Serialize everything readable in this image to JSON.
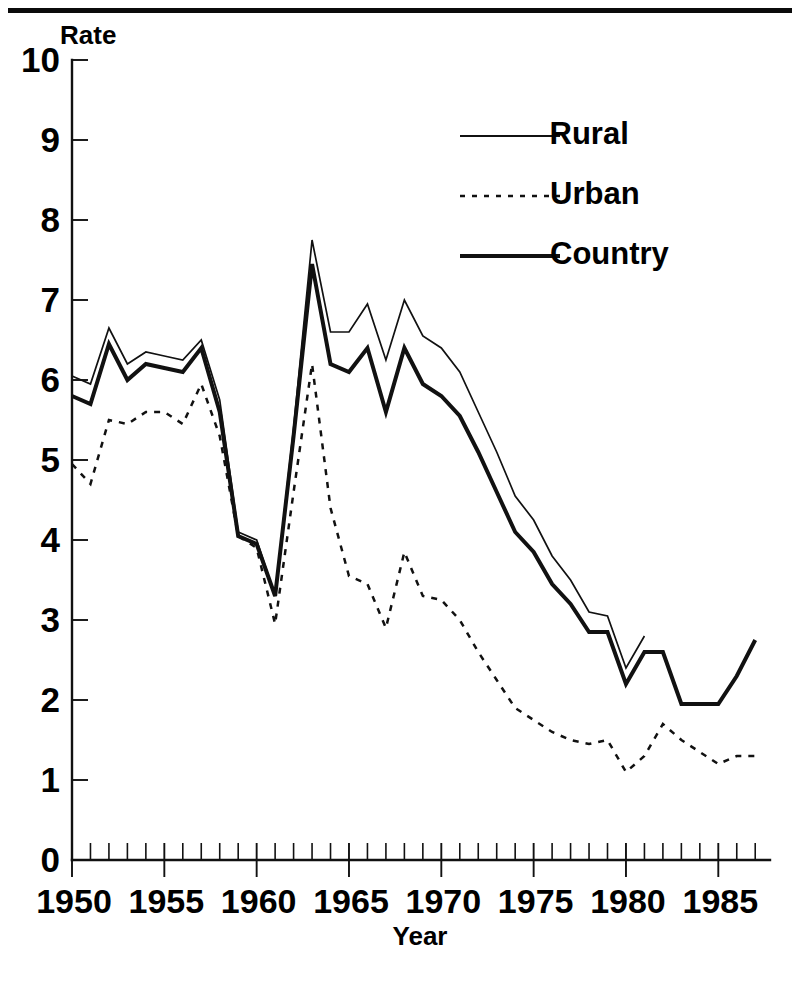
{
  "figure": {
    "has_top_rule": true,
    "background_color": "#ffffff",
    "ink_color": "#111111"
  },
  "chart_data": {
    "type": "line",
    "title": "",
    "subtitle": "",
    "xlabel": "Year",
    "ylabel": "Rate",
    "xlim": [
      1950,
      1987
    ],
    "ylim": [
      0,
      10
    ],
    "grid": false,
    "legend_position": "top-right",
    "y_ticks": [
      0,
      1,
      2,
      3,
      4,
      5,
      6,
      7,
      8,
      9,
      10
    ],
    "y_tick_labels": [
      "0",
      "1",
      "2",
      "3",
      "4",
      "5",
      "6",
      "7",
      "8",
      "9",
      "10"
    ],
    "x_major_ticks": [
      1950,
      1955,
      1960,
      1965,
      1970,
      1975,
      1980,
      1985
    ],
    "x_tick_labels": [
      "1950",
      "1955",
      "1960",
      "1965",
      "1970",
      "1975",
      "1980",
      "1985"
    ],
    "x_minor_tick_interval": 1,
    "series": [
      {
        "name": "Rural",
        "style": "solid-thin",
        "x": [
          1950,
          1951,
          1952,
          1953,
          1954,
          1955,
          1956,
          1957,
          1958,
          1959,
          1960,
          1961,
          1962,
          1963,
          1964,
          1965,
          1966,
          1967,
          1968,
          1969,
          1970,
          1971,
          1972,
          1973,
          1974,
          1975,
          1976,
          1977,
          1978,
          1979,
          1980,
          1981
        ],
        "values": [
          6.05,
          5.95,
          6.65,
          6.2,
          6.35,
          6.3,
          6.25,
          6.5,
          5.75,
          4.1,
          4.0,
          3.3,
          5.4,
          7.75,
          6.6,
          6.6,
          6.95,
          6.25,
          7.0,
          6.55,
          6.4,
          6.1,
          5.6,
          5.1,
          4.55,
          4.25,
          3.8,
          3.5,
          3.1,
          3.05,
          2.4,
          2.8
        ]
      },
      {
        "name": "Urban",
        "style": "dotted",
        "x": [
          1950,
          1951,
          1952,
          1953,
          1954,
          1955,
          1956,
          1957,
          1958,
          1959,
          1960,
          1961,
          1962,
          1963,
          1964,
          1965,
          1966,
          1967,
          1968,
          1969,
          1970,
          1971,
          1972,
          1973,
          1974,
          1975,
          1976,
          1977,
          1978,
          1979,
          1980,
          1981,
          1982,
          1983,
          1984,
          1985,
          1986,
          1987
        ],
        "values": [
          4.95,
          4.7,
          5.5,
          5.45,
          5.6,
          5.6,
          5.45,
          5.95,
          5.3,
          4.05,
          3.9,
          2.95,
          4.6,
          6.2,
          4.4,
          3.55,
          3.45,
          2.9,
          3.85,
          3.3,
          3.25,
          3.0,
          2.6,
          2.25,
          1.9,
          1.75,
          1.6,
          1.5,
          1.45,
          1.5,
          1.1,
          1.3,
          1.7,
          1.5,
          1.35,
          1.2,
          1.3,
          1.3
        ]
      },
      {
        "name": "Country",
        "style": "solid-thick",
        "x": [
          1950,
          1951,
          1952,
          1953,
          1954,
          1955,
          1956,
          1957,
          1958,
          1959,
          1960,
          1961,
          1962,
          1963,
          1964,
          1965,
          1966,
          1967,
          1968,
          1969,
          1970,
          1971,
          1972,
          1973,
          1974,
          1975,
          1976,
          1977,
          1978,
          1979,
          1980,
          1981,
          1982,
          1983,
          1984,
          1985,
          1986,
          1987
        ],
        "values": [
          5.8,
          5.7,
          6.45,
          6.0,
          6.2,
          6.15,
          6.1,
          6.4,
          5.6,
          4.05,
          3.95,
          3.3,
          5.3,
          7.45,
          6.2,
          6.1,
          6.4,
          5.6,
          6.4,
          5.95,
          5.8,
          5.55,
          5.1,
          4.6,
          4.1,
          3.85,
          3.45,
          3.2,
          2.85,
          2.85,
          2.2,
          2.6,
          2.6,
          1.95,
          1.95,
          1.95,
          2.3,
          2.75
        ]
      }
    ]
  },
  "legend": {
    "entries": [
      {
        "label": "Rural",
        "style": "solid-thin"
      },
      {
        "label": "Urban",
        "style": "dotted"
      },
      {
        "label": "Country",
        "style": "solid-thick"
      }
    ]
  }
}
